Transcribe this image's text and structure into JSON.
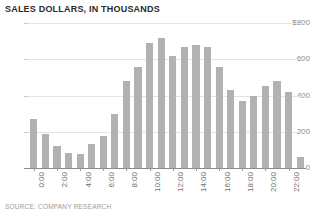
{
  "chart_data": {
    "type": "bar",
    "title": "SALES DOLLARS, IN THOUSANDS",
    "source_note": "SOURCE: COMPANY RESEARCH",
    "xlabel": "",
    "ylabel": "",
    "ylim": [
      0,
      800
    ],
    "grid": true,
    "legend": "none",
    "bar_color": "#b2b2b2",
    "gridline_color": "#e4e4e4",
    "axis_color": "#8c8c8c",
    "y_ticks": [
      {
        "value": 800,
        "label": "$800"
      },
      {
        "value": 600,
        "label": "600"
      },
      {
        "value": 400,
        "label": "400"
      },
      {
        "value": 200,
        "label": "200"
      },
      {
        "value": 0,
        "label": "0"
      }
    ],
    "x_tick_labels": [
      "0:00",
      "2:00",
      "4:00",
      "6:00",
      "8:00",
      "10:00",
      "12:00",
      "14:00",
      "16:00",
      "18:00",
      "20:00",
      "22:00"
    ],
    "x_tick_every": 2,
    "categories": [
      "0:00",
      "1:00",
      "2:00",
      "3:00",
      "4:00",
      "5:00",
      "6:00",
      "7:00",
      "8:00",
      "9:00",
      "10:00",
      "11:00",
      "12:00",
      "13:00",
      "14:00",
      "15:00",
      "16:00",
      "17:00",
      "18:00",
      "19:00",
      "20:00",
      "21:00",
      "22:00",
      "23:00"
    ],
    "values": [
      270,
      190,
      120,
      85,
      75,
      130,
      175,
      300,
      480,
      560,
      690,
      720,
      620,
      670,
      680,
      670,
      560,
      430,
      370,
      400,
      450,
      480,
      420,
      60
    ]
  }
}
